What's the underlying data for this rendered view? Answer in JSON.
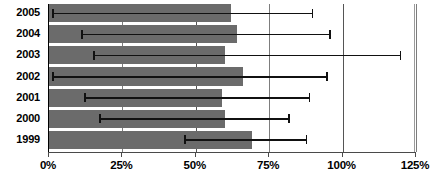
{
  "chart_data": {
    "type": "bar",
    "orientation": "horizontal",
    "title": "",
    "subtitle": "",
    "xlabel": "",
    "ylabel": "",
    "xlim": [
      0,
      125
    ],
    "ylim": null,
    "grid": true,
    "legend": null,
    "legend_position": "none",
    "categories": [
      "2005",
      "2004",
      "2003",
      "2002",
      "2001",
      "2000",
      "1999"
    ],
    "values": [
      62,
      64,
      60,
      66,
      59,
      60,
      69
    ],
    "series": [
      {
        "name": "value",
        "values": [
          62,
          64,
          60,
          66,
          59,
          60,
          69
        ]
      }
    ],
    "error_bars": [
      {
        "category": "2005",
        "low": 1,
        "high": 90
      },
      {
        "category": "2004",
        "low": 11,
        "high": 96
      },
      {
        "category": "2003",
        "low": 15,
        "high": 120
      },
      {
        "category": "2002",
        "low": 1,
        "high": 95
      },
      {
        "category": "2001",
        "low": 12,
        "high": 89
      },
      {
        "category": "2000",
        "low": 17,
        "high": 82
      },
      {
        "category": "1999",
        "low": 46,
        "high": 88
      }
    ],
    "x_tick_values": [
      0,
      25,
      50,
      75,
      100,
      125
    ],
    "x_tick_labels": [
      "0%",
      "25%",
      "50%",
      "75%",
      "100%",
      "125%"
    ],
    "y_tick_labels": [
      "2005",
      "2004",
      "2003",
      "2002",
      "2001",
      "2000",
      "1999"
    ],
    "colors": {
      "bar_fill": "#6b6b6b",
      "error_bar": "#111111",
      "gridline": "#7d7d7d",
      "axis": "#4a4a4a",
      "background": "#ffffff",
      "text": "#000000"
    },
    "annotations": []
  }
}
